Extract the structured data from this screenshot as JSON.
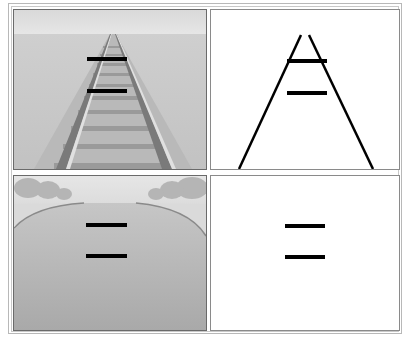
{
  "figure": {
    "panels": [
      {
        "id": "railroad-photo",
        "description": "Railroad tracks converging toward horizon with two equal horizontal bars"
      },
      {
        "id": "railroad-line-drawing",
        "description": "Two converging lines with two equal horizontal bars"
      },
      {
        "id": "road-photo",
        "description": "Road receding toward horizon with two equal horizontal bars"
      },
      {
        "id": "bars-only",
        "description": "Two equal horizontal bars with no context"
      }
    ],
    "bar_color": "#000000",
    "bar_count_per_panel": 2,
    "bars_equal_length": true
  }
}
